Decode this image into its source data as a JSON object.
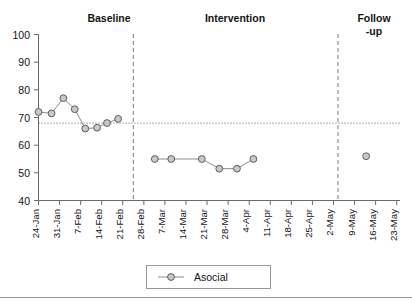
{
  "chart_data": {
    "type": "line",
    "title": "",
    "xlabel": "",
    "ylabel": "",
    "ylim": [
      40,
      100
    ],
    "ytick_values": [
      40,
      50,
      60,
      70,
      80,
      90,
      100
    ],
    "ytick_labels": [
      "40",
      "50",
      "60",
      "70",
      "80",
      "90",
      "100"
    ],
    "grid": false,
    "legend_position": "bottom-center",
    "categories": [
      "24-Jan",
      "31-Jan",
      "7-Feb",
      "14-Feb",
      "21-Feb",
      "28-Feb",
      "7-Mar",
      "14-Mar",
      "21-Mar",
      "28-Mar",
      "4-Apr",
      "11-Apr",
      "18-Apr",
      "25-Apr",
      "2-May",
      "9-May",
      "16-May",
      "23-May"
    ],
    "series": [
      {
        "name": "Asocial",
        "marker": "circle",
        "points": [
          {
            "x": 0.0,
            "y": 72
          },
          {
            "x": 0.62,
            "y": 71.5
          },
          {
            "x": 1.18,
            "y": 77
          },
          {
            "x": 1.72,
            "y": 73
          },
          {
            "x": 2.22,
            "y": 66
          },
          {
            "x": 2.78,
            "y": 66.3
          },
          {
            "x": 3.25,
            "y": 68
          },
          {
            "x": 3.78,
            "y": 69.5
          }
        ]
      },
      {
        "name": "Asocial",
        "marker": "circle",
        "points": [
          {
            "x": 5.52,
            "y": 55
          },
          {
            "x": 6.3,
            "y": 55
          },
          {
            "x": 7.75,
            "y": 55
          },
          {
            "x": 8.58,
            "y": 51.5
          },
          {
            "x": 9.42,
            "y": 51.5
          },
          {
            "x": 10.2,
            "y": 55
          }
        ]
      },
      {
        "name": "Asocial",
        "marker": "circle",
        "points": [
          {
            "x": 15.55,
            "y": 56
          }
        ]
      }
    ],
    "reference_line": {
      "value": 68,
      "style": "dotted"
    },
    "phase_dividers": [
      4.5,
      13.6
    ],
    "annotations": [
      {
        "text": "Baseline",
        "position": "top",
        "phase": 1
      },
      {
        "text": "Intervention",
        "position": "top",
        "phase": 2
      },
      {
        "text": "Follow",
        "text2": "-up",
        "position": "top",
        "phase": 3
      }
    ]
  },
  "phases": [
    {
      "label": "Baseline"
    },
    {
      "label": "Intervention"
    },
    {
      "label": "Follow"
    },
    {
      "label": "-up"
    }
  ],
  "legend": {
    "entries": [
      {
        "label": "Asocial",
        "marker": "circle-line"
      }
    ]
  },
  "colors": {
    "marker_fill": "#c9c9c9",
    "marker_stroke": "#5d5d5d",
    "line": "#8c8c8c",
    "axis": "#6a6a6a",
    "text": "#141414",
    "background": "#ffffff"
  }
}
